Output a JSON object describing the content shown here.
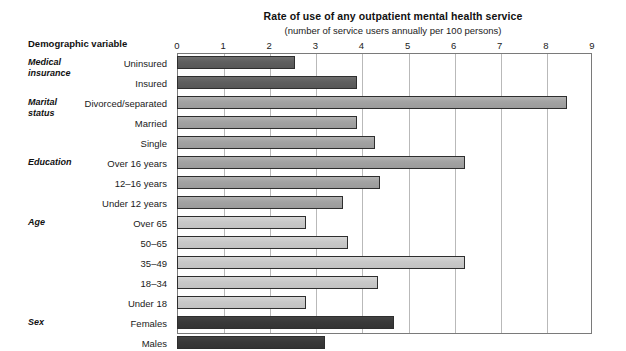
{
  "header": {
    "column_header": "Demographic variable"
  },
  "chart_data": {
    "type": "bar",
    "orientation": "horizontal",
    "title": "Rate of use of any outpatient mental health service",
    "subtitle": "(number of service users annually per 100 persons)",
    "xlabel": "",
    "ylabel": "Demographic variable",
    "xlim": [
      0,
      9
    ],
    "xticks": [
      0,
      1,
      2,
      3,
      4,
      5,
      6,
      7,
      8,
      9
    ],
    "xtick_labels": [
      "0",
      "1",
      "2",
      "3",
      "4",
      "5",
      "6",
      "7",
      "8",
      "9"
    ],
    "grid": true,
    "legend": "none",
    "categories": [
      "Uninsured",
      "Insured",
      "Divorced/separated",
      "Married",
      "Single",
      "Over 16 years",
      "12–16 years",
      "Under 12 years",
      "Over 65",
      "50–65",
      "35–49",
      "18–34",
      "Under 18",
      "Females",
      "Males"
    ],
    "values": [
      2.55,
      3.9,
      8.45,
      3.9,
      4.3,
      6.25,
      4.4,
      3.6,
      2.8,
      3.7,
      6.25,
      4.35,
      2.8,
      4.7,
      3.2
    ],
    "bar_shades": [
      "dark",
      "dark",
      "mid",
      "mid",
      "mid",
      "mid",
      "mid",
      "mid",
      "light",
      "light",
      "light",
      "light",
      "light",
      "black",
      "black"
    ],
    "groups": [
      {
        "label": "Medical\ninsurance",
        "lines": [
          "Medical",
          "insurance"
        ],
        "start_index": 0,
        "count": 2
      },
      {
        "label": "Marital\nstatus",
        "lines": [
          "Marital",
          "status"
        ],
        "start_index": 2,
        "count": 3
      },
      {
        "label": "Education",
        "lines": [
          "Education"
        ],
        "start_index": 5,
        "count": 3
      },
      {
        "label": "Age",
        "lines": [
          "Age"
        ],
        "start_index": 8,
        "count": 5
      },
      {
        "label": "Sex",
        "lines": [
          "Sex"
        ],
        "start_index": 13,
        "count": 2
      }
    ],
    "colors": {
      "dark": "#5f5f5f",
      "mid": "#a2a2a2",
      "light": "#c8c8c8",
      "black": "#393939",
      "bar_outline": "#2e2e2e",
      "gridline": "#b9b9b9",
      "axis": "#7a7a7a"
    }
  }
}
